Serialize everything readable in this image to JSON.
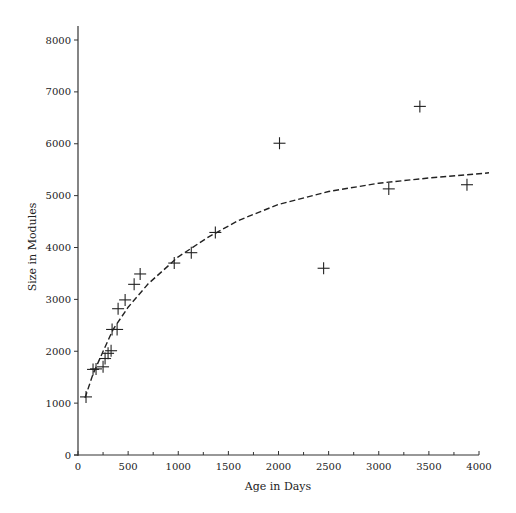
{
  "chart_data": {
    "type": "scatter",
    "title": "",
    "xlabel": "Age in Days",
    "ylabel": "Size in Modules",
    "xlim": [
      0,
      4000
    ],
    "ylim": [
      0,
      8000
    ],
    "x_ticks": [
      0,
      500,
      1000,
      1500,
      2000,
      2500,
      3000,
      3500,
      4000
    ],
    "x_minor_ticks": [
      250,
      750,
      1250,
      1750,
      2250,
      2750,
      3250,
      3750
    ],
    "y_ticks": [
      0,
      1000,
      2000,
      3000,
      4000,
      5000,
      6000,
      7000,
      8000
    ],
    "grid": false,
    "legend": null,
    "series": [
      {
        "name": "observations",
        "marker": "plus",
        "points": [
          [
            80,
            1120
          ],
          [
            150,
            1650
          ],
          [
            180,
            1660
          ],
          [
            250,
            1700
          ],
          [
            270,
            1860
          ],
          [
            300,
            1960
          ],
          [
            330,
            2010
          ],
          [
            340,
            2420
          ],
          [
            390,
            2420
          ],
          [
            400,
            2820
          ],
          [
            470,
            2990
          ],
          [
            560,
            3290
          ],
          [
            620,
            3490
          ],
          [
            960,
            3700
          ],
          [
            1130,
            3900
          ],
          [
            1370,
            4290
          ],
          [
            2010,
            6010
          ],
          [
            2450,
            3600
          ],
          [
            3100,
            5130
          ],
          [
            3410,
            6720
          ],
          [
            3880,
            5210
          ]
        ]
      },
      {
        "name": "fitted curve",
        "style": "dashed",
        "points": [
          [
            70,
            1100
          ],
          [
            150,
            1560
          ],
          [
            250,
            2000
          ],
          [
            350,
            2420
          ],
          [
            500,
            2850
          ],
          [
            700,
            3300
          ],
          [
            1000,
            3820
          ],
          [
            1300,
            4200
          ],
          [
            1600,
            4520
          ],
          [
            2000,
            4830
          ],
          [
            2500,
            5080
          ],
          [
            3000,
            5240
          ],
          [
            3500,
            5340
          ],
          [
            4000,
            5420
          ],
          [
            4100,
            5440
          ]
        ]
      }
    ]
  }
}
